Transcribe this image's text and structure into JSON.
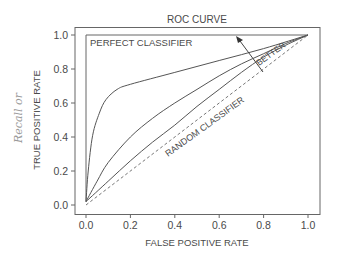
{
  "chart_data": {
    "type": "line",
    "title": "ROC CURVE",
    "xlabel": "FALSE POSITIVE RATE",
    "ylabel": "TRUE POSITIVE RATE",
    "ylabel_annotation": "Recall or",
    "xlim": [
      0.0,
      1.0
    ],
    "ylim": [
      0.0,
      1.0
    ],
    "xticks": [
      "0.0",
      "0.2",
      "0.4",
      "0.6",
      "0.8",
      "1.0"
    ],
    "yticks": [
      "0.0",
      "0.2",
      "0.4",
      "0.6",
      "0.8",
      "1.0"
    ],
    "grid": false,
    "legend": null,
    "series": [
      {
        "name": "Perfect classifier",
        "style": "solid",
        "x": [
          0.0,
          0.0,
          1.0
        ],
        "y": [
          0.02,
          1.0,
          1.0
        ]
      },
      {
        "name": "Good classifier",
        "style": "solid",
        "x": [
          0.0,
          0.01,
          0.03,
          0.06,
          0.09,
          0.14,
          0.2,
          0.4,
          0.6,
          0.8,
          1.0
        ],
        "y": [
          0.02,
          0.2,
          0.41,
          0.54,
          0.62,
          0.68,
          0.71,
          0.78,
          0.85,
          0.92,
          1.0
        ]
      },
      {
        "name": "Medium classifier",
        "style": "solid",
        "x": [
          0.0,
          0.05,
          0.1,
          0.2,
          0.3,
          0.4,
          0.5,
          0.6,
          0.7,
          0.8,
          0.9,
          1.0
        ],
        "y": [
          0.02,
          0.14,
          0.25,
          0.4,
          0.51,
          0.6,
          0.68,
          0.76,
          0.83,
          0.89,
          0.95,
          1.0
        ]
      },
      {
        "name": "Weak classifier",
        "style": "solid",
        "x": [
          0.0,
          0.1,
          0.2,
          0.3,
          0.4,
          0.5,
          0.6,
          0.7,
          0.8,
          0.9,
          1.0
        ],
        "y": [
          0.02,
          0.14,
          0.26,
          0.37,
          0.47,
          0.58,
          0.68,
          0.78,
          0.87,
          0.94,
          1.0
        ]
      },
      {
        "name": "Random classifier",
        "style": "dashed",
        "x": [
          0.0,
          1.0
        ],
        "y": [
          0.0,
          1.0
        ]
      }
    ],
    "annotations": [
      {
        "text": "PERFECT CLASSIFIER",
        "x": 0.02,
        "y": 0.95
      },
      {
        "text": "BETTER",
        "x": 0.85,
        "y": 0.9,
        "rotation": -35,
        "arrow_from": [
          0.8,
          0.78
        ],
        "arrow_to": [
          0.68,
          0.97
        ]
      },
      {
        "text": "RANDOM CLASSIFIER",
        "x": 0.55,
        "y": 0.45,
        "rotation": -35
      }
    ]
  },
  "labels": {
    "title": "ROC CURVE",
    "xlabel": "FALSE POSITIVE RATE",
    "ylabel": "TRUE POSITIVE RATE",
    "hand": "Recall or",
    "perfect": "PERFECT CLASSIFIER",
    "better": "BETTER",
    "random": "RANDOM CLASSIFIER"
  }
}
